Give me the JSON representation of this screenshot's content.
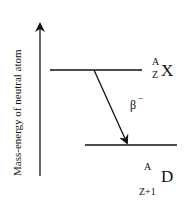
{
  "diagram": {
    "axis_label": "Mass-energy of neutral atom",
    "parent": {
      "mass_number": "A",
      "atomic_number": "Z",
      "symbol": "X"
    },
    "transition": {
      "label": "β",
      "sign": "−"
    },
    "daughter": {
      "mass_number": "A",
      "atomic_number": "Z+1",
      "symbol": "D"
    },
    "colors": {
      "line": "#111111",
      "background": "#ffffff"
    }
  }
}
